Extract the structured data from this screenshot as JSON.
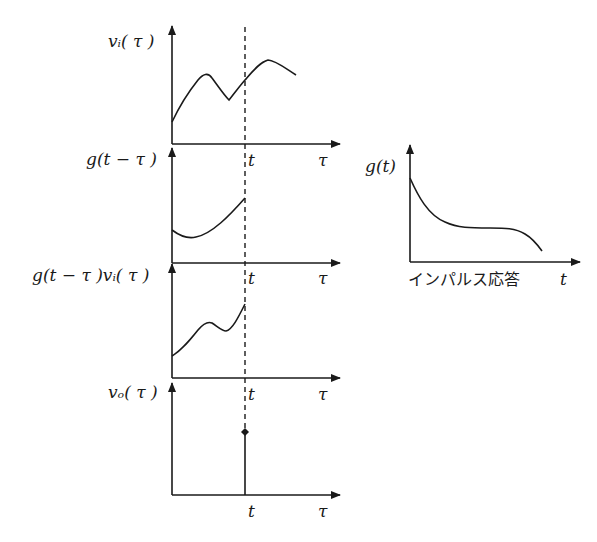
{
  "diagram": {
    "panels": [
      {
        "id": "input",
        "y_label": "vᵢ( τ )",
        "x_tick": "t",
        "x_label": "τ"
      },
      {
        "id": "flipped-response",
        "y_label": "g(t − τ )",
        "x_tick": "t",
        "x_label": "τ"
      },
      {
        "id": "product",
        "y_label": "g(t − τ )vᵢ( τ )",
        "x_tick": "t",
        "x_label": "τ"
      },
      {
        "id": "output",
        "y_label": "vₒ( τ )",
        "x_tick": "t",
        "x_label": "τ"
      }
    ],
    "impulse_response": {
      "y_label": "g(t)",
      "caption": "インパルス応答",
      "x_label": "t"
    }
  }
}
